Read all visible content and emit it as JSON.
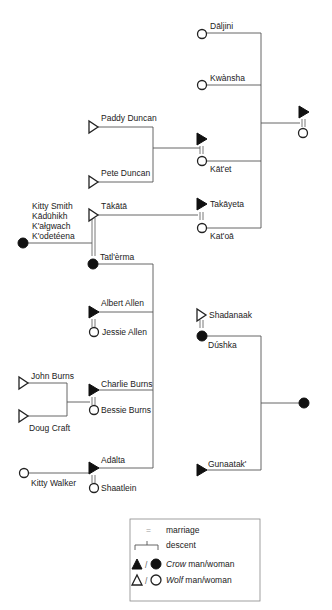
{
  "diagram": {
    "type": "kinship",
    "people": [
      {
        "id": "daljini",
        "name": "Dāljini",
        "sex": "female",
        "moiety": "wolf"
      },
      {
        "id": "kwansha",
        "name": "Kwànsha",
        "sex": "female",
        "moiety": "wolf"
      },
      {
        "id": "paddy",
        "name": "Paddy Duncan",
        "sex": "male",
        "moiety": "wolf"
      },
      {
        "id": "pete",
        "name": "Pete Duncan",
        "sex": "male",
        "moiety": "wolf"
      },
      {
        "id": "katet_h",
        "name": "",
        "sex": "male",
        "moiety": "crow"
      },
      {
        "id": "katet",
        "name": "Kāt'et",
        "sex": "female",
        "moiety": "wolf"
      },
      {
        "id": "top_right_m",
        "name": "",
        "sex": "male",
        "moiety": "crow"
      },
      {
        "id": "top_right_f",
        "name": "",
        "sex": "female",
        "moiety": "wolf"
      },
      {
        "id": "kitty_smith",
        "name": "Kitty Smith Kādūhikh K'ałgwach K'odetéena",
        "name_lines": [
          "Kitty Smith",
          "Kādūhikh",
          "K'ałgwach",
          "K'odetéena"
        ],
        "sex": "female",
        "moiety": "crow"
      },
      {
        "id": "takata",
        "name": "Tākātā",
        "sex": "male",
        "moiety": "wolf"
      },
      {
        "id": "takayeta",
        "name": "Takāyeta",
        "sex": "male",
        "moiety": "crow"
      },
      {
        "id": "katoa",
        "name": "Kat'oā",
        "sex": "female",
        "moiety": "wolf"
      },
      {
        "id": "tatlerma",
        "name": "Tatl'èrma",
        "sex": "female",
        "moiety": "crow"
      },
      {
        "id": "albert",
        "name": "Albert Allen",
        "sex": "male",
        "moiety": "crow"
      },
      {
        "id": "jessie",
        "name": "Jessie Allen",
        "sex": "female",
        "moiety": "wolf"
      },
      {
        "id": "john",
        "name": "John Burns",
        "sex": "male",
        "moiety": "wolf"
      },
      {
        "id": "doug",
        "name": "Doug Craft",
        "sex": "male",
        "moiety": "wolf"
      },
      {
        "id": "charlie",
        "name": "Charlie Burns",
        "sex": "male",
        "moiety": "crow"
      },
      {
        "id": "bessie",
        "name": "Bessie Burns",
        "sex": "female",
        "moiety": "wolf"
      },
      {
        "id": "kitty_walker",
        "name": "Kitty Walker",
        "sex": "female",
        "moiety": "wolf"
      },
      {
        "id": "adalta",
        "name": "Adālta",
        "sex": "male",
        "moiety": "crow"
      },
      {
        "id": "shaatlein",
        "name": "Shaatlein",
        "sex": "female",
        "moiety": "wolf"
      },
      {
        "id": "shadanaak",
        "name": "Shadanaak",
        "sex": "male",
        "moiety": "wolf"
      },
      {
        "id": "dushka",
        "name": "Dúshka",
        "sex": "female",
        "moiety": "crow"
      },
      {
        "id": "gunaatak",
        "name": "Gunaatak'",
        "sex": "male",
        "moiety": "crow"
      },
      {
        "id": "right_mother",
        "name": "",
        "sex": "female",
        "moiety": "crow"
      }
    ],
    "marriages": [
      [
        "katet_h",
        "katet"
      ],
      [
        "top_right_m",
        "top_right_f"
      ],
      [
        "takata",
        "kitty_smith"
      ],
      [
        "takayeta",
        "katoa"
      ],
      [
        "albert",
        "jessie"
      ],
      [
        "charlie",
        "bessie"
      ],
      [
        "adalta",
        "shaatlein"
      ],
      [
        "shadanaak",
        "dushka"
      ]
    ]
  },
  "labels": {
    "daljini": "Dāljini",
    "kwansha": "Kwànsha",
    "paddy": "Paddy Duncan",
    "pete": "Pete Duncan",
    "katet": "Kāt'et",
    "kitty_smith": [
      "Kitty Smith",
      "Kādūhikh",
      "K'ałgwach",
      "K'odetéena"
    ],
    "takata": "Tākātā",
    "takayeta": "Takāyeta",
    "katoa": "Kat'oā",
    "tatlerma": "Tatl'èrma",
    "albert": "Albert Allen",
    "jessie": "Jessie Allen",
    "john": "John Burns",
    "doug": "Doug Craft",
    "charlie": "Charlie Burns",
    "bessie": "Bessie Burns",
    "kitty_walker": "Kitty Walker",
    "adalta": "Adālta",
    "shaatlein": "Shaatlein",
    "shadanaak": "Shadanaak",
    "dushka": "Dúshka",
    "gunaatak": "Gunaatak'"
  },
  "legend": {
    "marriage_symbol": "=",
    "marriage": "marriage",
    "descent": "descent",
    "crow": "Crow man/woman",
    "crow_italic": "Crow",
    "crow_rest": " man/woman",
    "wolf_italic": "Wolf",
    "wolf_rest": " man/woman",
    "slash": "/"
  },
  "colors": {
    "line": "#555555",
    "crow_fill": "#111111",
    "wolf_fill": "#ffffff"
  }
}
